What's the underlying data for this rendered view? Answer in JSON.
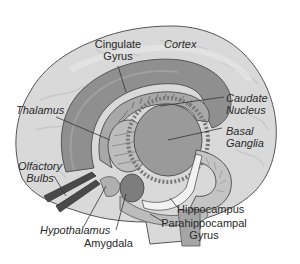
{
  "diagram": {
    "colors": {
      "background": "#ffffff",
      "cortex_fill": "#d9d9d9",
      "cortex_highlight": "#e6e6e6",
      "outline": "#555555",
      "cingulate_fill": "#8f8f8f",
      "caudate_fill": "#a8a8a8",
      "basal_ganglia_fill": "#9a9a9a",
      "thalamus_fill": "#bdbdbd",
      "hippocampus_fill": "#c4c4c4",
      "amygdala_fill": "#7d7d7d",
      "fornix_fill": "#f2f2f2",
      "olfactory_fill": "#4a4a4a",
      "brainstem_fill": "#a5a5a5",
      "leader_line": "#333333",
      "label_text": "#2a2a2a"
    },
    "labels": {
      "cingulate_gyrus": {
        "line1": "Cingulate",
        "line2": "Gyrus"
      },
      "cortex": "Cortex",
      "thalamus": "Thalamus",
      "caudate_nucleus": {
        "line1": "Caudate",
        "line2": "Nucleus"
      },
      "basal_ganglia": {
        "line1": "Basal",
        "line2": "Ganglia"
      },
      "olfactory_bulbs": {
        "line1": "Olfactory",
        "line2": "Bulbs"
      },
      "hypothalamus": "Hypothalamus",
      "amygdala": "Amygdala",
      "hippocampus": "Hippocampus",
      "parahippocampal_gyrus": {
        "line1": "Parahippocampal",
        "line2": "Gyrus"
      }
    }
  }
}
